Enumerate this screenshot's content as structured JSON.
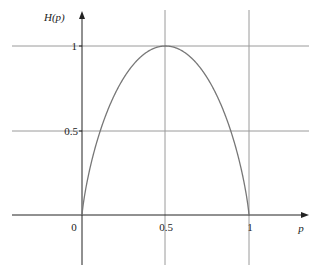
{
  "chart_data": {
    "type": "line",
    "title": "",
    "xlabel": "p",
    "ylabel": "H(p)",
    "function": "H(p) = -p log2 p - (1-p) log2 (1-p)",
    "x": [
      0,
      0.05,
      0.1,
      0.2,
      0.3,
      0.4,
      0.5,
      0.6,
      0.7,
      0.8,
      0.9,
      0.95,
      1
    ],
    "series": [
      {
        "name": "H(p)",
        "values": [
          0,
          0.286,
          0.469,
          0.722,
          0.881,
          0.971,
          1.0,
          0.971,
          0.881,
          0.722,
          0.469,
          0.286,
          0
        ]
      }
    ],
    "x_ticks": [
      "0",
      "0.5",
      "1"
    ],
    "y_ticks": [
      "0.5",
      "1"
    ],
    "xlim": [
      -0.4,
      1.15
    ],
    "ylim": [
      -0.3,
      1.2
    ],
    "grid": true,
    "legend": "none"
  },
  "labels": {
    "ylabel": "H(p)",
    "xlabel": "p",
    "x0": "0",
    "x05": "0.5",
    "x1": "1",
    "y05": "0.5",
    "y1": "1"
  },
  "colors": {
    "axis": "#222222",
    "grid": "#9a9a9a",
    "curve": "#777777"
  }
}
